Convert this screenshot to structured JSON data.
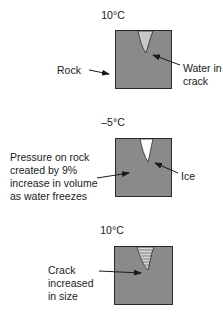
{
  "diagram": {
    "stages": [
      {
        "temperature": "10°C",
        "labels": {
          "left": "Rock",
          "right_line1": "Water in",
          "right_line2": "crack"
        }
      },
      {
        "temperature": "–5°C",
        "labels": {
          "left_line1": "Pressure on rock",
          "left_line2": "created by 9%",
          "left_line3": "increase in volume",
          "left_line4": "as water freezes",
          "right": "Ice"
        }
      },
      {
        "temperature": "10°C",
        "labels": {
          "left_line1": "Crack",
          "left_line2": "increased",
          "left_line3": "in size"
        }
      }
    ],
    "colors": {
      "rock": "#8a8a8a",
      "rock_border": "#2a2a2a",
      "water": "#c9c9c9",
      "ice": "#ffffff",
      "text": "#1a1a1a"
    }
  }
}
